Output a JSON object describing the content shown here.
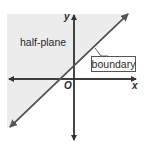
{
  "diagram": {
    "labels": {
      "half_plane": "half-plane",
      "boundary": "boundary",
      "x_axis": "x",
      "y_axis": "y",
      "origin": "O"
    },
    "colors": {
      "shade": "#ececec",
      "line": "#555555",
      "axis": "#333333",
      "text": "#2a2a2a"
    },
    "geometry": {
      "origin_px": [
        74,
        79
      ],
      "boundary_line_endpoints_px": [
        [
          9,
          128
        ],
        [
          128,
          14
        ]
      ],
      "shaded_side": "above-left of boundary"
    }
  }
}
